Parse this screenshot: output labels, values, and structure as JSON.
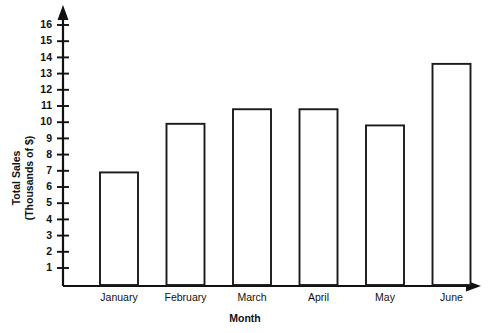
{
  "chart_data": {
    "type": "bar",
    "title": "",
    "subtitle": "",
    "categories": [
      "January",
      "February",
      "March",
      "April",
      "May",
      "June"
    ],
    "values": [
      6.9,
      9.9,
      10.8,
      10.8,
      9.8,
      13.6
    ],
    "xlabel": "Month",
    "ylabel": "Total Sales (Thousands of $)",
    "ylabel_lines": [
      "Total Sales",
      "(Thousands of $)"
    ],
    "ytick_labels": [
      "1",
      "2",
      "3",
      "4",
      "5",
      "6",
      "7",
      "8",
      "9",
      "10",
      "11",
      "12",
      "13",
      "14",
      "15",
      "16"
    ],
    "ytick_values": [
      1,
      2,
      3,
      4,
      5,
      6,
      7,
      8,
      9,
      10,
      11,
      12,
      13,
      14,
      15,
      16
    ],
    "ylim": [
      0,
      17
    ],
    "grid": false,
    "legend": false,
    "legend_position": "none",
    "bar_fill": "#ffffff",
    "bar_stroke": "#1a1a1a",
    "background": "#ffffff",
    "axis_color": "#111111",
    "axis_arrows": {
      "y_axis": "up-arrow",
      "x_axis": "right-arrow"
    }
  }
}
